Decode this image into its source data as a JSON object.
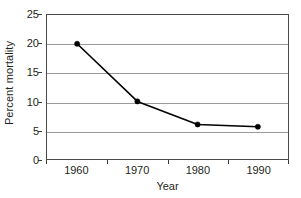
{
  "chart_data": {
    "type": "line",
    "title": "",
    "xlabel": "Year",
    "ylabel": "Percent mortality",
    "categories": [
      "1960",
      "1970",
      "1980",
      "1990"
    ],
    "values": [
      20,
      10,
      6,
      5.6
    ],
    "series": [
      {
        "name": "Percent mortality",
        "values": [
          20,
          10,
          6,
          5.6
        ]
      }
    ],
    "ylim": [
      0,
      25
    ],
    "y_ticks": [
      "0",
      "5",
      "10",
      "15",
      "20",
      "25"
    ],
    "y_tick_values": [
      0,
      5,
      10,
      15,
      20,
      25
    ],
    "x_ticks": [
      "1960",
      "1970",
      "1980",
      "1990"
    ],
    "grid": "horizontal",
    "legend": "none",
    "axis_type_x": "category",
    "colors": {
      "line": "#000000",
      "marker": "#000000",
      "gridline": "#9a9a9a",
      "axis": "#4a4a4a",
      "text": "#231f20",
      "background": "#ffffff"
    },
    "marker_style": "filled-circle",
    "line_width": 1.6
  }
}
